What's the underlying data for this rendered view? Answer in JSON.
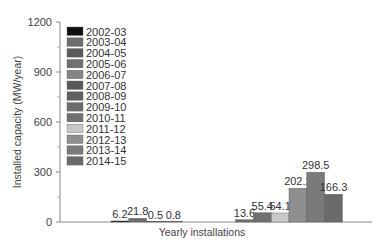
{
  "chart_data": {
    "type": "bar",
    "title": "",
    "xlabel": "Yearly installations",
    "ylabel": "Installed capacity (MW/year)",
    "ylim": [
      0,
      1200
    ],
    "yticks": [
      0,
      300,
      600,
      900,
      1200
    ],
    "grid": false,
    "legend_position": "upper-left",
    "categories": [
      "2002-03",
      "2003-04",
      "2004-05",
      "2005-06",
      "2006-07",
      "2007-08",
      "2008-09",
      "2009-10",
      "2010-11",
      "2011-12",
      "2012-13",
      "2013-14",
      "2014-15"
    ],
    "values": [
      6.2,
      21.8,
      0.5,
      0.8,
      null,
      null,
      null,
      13.6,
      55.4,
      54.1,
      202.2,
      298.5,
      166.3
    ],
    "colors": [
      "#111111",
      "#6e6e6e",
      "#5a5a5a",
      "#707070",
      "#858585",
      "#595959",
      "#606060",
      "#6c6c6c",
      "#707070",
      "#c8c8c8",
      "#8e8e8e",
      "#7a7a7a",
      "#6a6a6a"
    ]
  },
  "axis": {
    "ylabel": "Installed capacity (MW/year)",
    "xlabel": "Yearly installations",
    "yticks": [
      "0",
      "300",
      "600",
      "900",
      "1200"
    ]
  },
  "legend": [
    {
      "label": "2002-03",
      "color": "#111111"
    },
    {
      "label": "2003-04",
      "color": "#6e6e6e"
    },
    {
      "label": "2004-05",
      "color": "#5a5a5a"
    },
    {
      "label": "2005-06",
      "color": "#707070"
    },
    {
      "label": "2006-07",
      "color": "#858585"
    },
    {
      "label": "2007-08",
      "color": "#595959"
    },
    {
      "label": "2008-09",
      "color": "#606060"
    },
    {
      "label": "2009-10",
      "color": "#6c6c6c"
    },
    {
      "label": "2010-11",
      "color": "#707070"
    },
    {
      "label": "2011-12",
      "color": "#c8c8c8"
    },
    {
      "label": "2012-13",
      "color": "#8e8e8e"
    },
    {
      "label": "2013-14",
      "color": "#7a7a7a"
    },
    {
      "label": "2014-15",
      "color": "#6a6a6a"
    }
  ],
  "bar_labels": [
    "6.2",
    "21.8",
    "0.5",
    "0.8",
    "",
    "",
    "",
    "13.6",
    "55.4",
    "54.1",
    "202.2",
    "298.5",
    "166.3"
  ]
}
